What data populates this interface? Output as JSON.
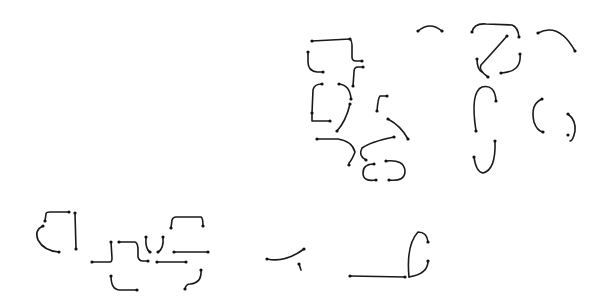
{
  "canvas": {
    "width": 605,
    "height": 304,
    "background": "#ffffff"
  },
  "style": {
    "stroke_color": "#1a1a1a",
    "stroke_width": 1.6,
    "endpoint_color": "#111111",
    "endpoint_radius": 1.6
  },
  "diagram": {
    "type": "stroke-primitives",
    "groups": [
      {
        "name": "upper-left-cluster",
        "strokes": [
          {
            "id": "s1",
            "d": "M312,41 L350,39",
            "ends": [
              [
                312,
                41
              ],
              [
                350,
                39
              ]
            ]
          },
          {
            "id": "s2",
            "d": "M350,39 Q352,41 352,45 L352,57 Q352,61 356,61 L362,61",
            "ends": [
              [
                362,
                61
              ]
            ]
          },
          {
            "id": "s3",
            "d": "M308,52 L308,62 Q308,71 317,72 L323,72",
            "ends": [
              [
                308,
                52
              ],
              [
                323,
                72
              ]
            ]
          },
          {
            "id": "s4",
            "d": "M363,67 L358,67 Q354,67 354,72 L353,86",
            "ends": [
              [
                363,
                67
              ],
              [
                353,
                86
              ]
            ]
          },
          {
            "id": "s5",
            "d": "M312,113 L313,90 Q314,84 322,84",
            "ends": [
              [
                322,
                84
              ],
              [
                312,
                113
              ]
            ]
          },
          {
            "id": "s6",
            "d": "M312,113 L312,121 L330,121",
            "ends": [
              [
                330,
                121
              ]
            ]
          },
          {
            "id": "s7",
            "d": "M339,84 Q350,85 351,99",
            "ends": [
              [
                339,
                84
              ],
              [
                351,
                99
              ]
            ]
          },
          {
            "id": "s8",
            "d": "M350,104 Q346,121 337,131",
            "ends": [
              [
                350,
                104
              ],
              [
                337,
                131
              ]
            ]
          },
          {
            "id": "s9",
            "d": "M377,111 Q378,98 380,96 L387,96",
            "ends": [
              [
                377,
                111
              ],
              [
                387,
                96
              ]
            ]
          },
          {
            "id": "s10",
            "d": "M388,119 Q401,126 408,139",
            "ends": [
              [
                388,
                119
              ],
              [
                408,
                139
              ]
            ]
          },
          {
            "id": "s11",
            "d": "M317,139 L338,139 Q352,141 355,152 Q352,160 349,163 L349,165",
            "ends": [
              [
                317,
                139
              ],
              [
                349,
                165
              ]
            ]
          },
          {
            "id": "s12",
            "d": "M394,137 Q370,142 362,148 Q358,156 366,160",
            "ends": [
              [
                394,
                137
              ],
              [
                366,
                160
              ]
            ]
          },
          {
            "id": "s13",
            "d": "M374,164 Q363,164 363,173 Q363,182 376,180",
            "ends": [
              [
                374,
                164
              ],
              [
                376,
                180
              ]
            ]
          },
          {
            "id": "s14",
            "d": "M386,161 Q404,159 405,171 Q405,182 389,180",
            "ends": [
              [
                386,
                161
              ],
              [
                389,
                180
              ]
            ]
          }
        ]
      },
      {
        "name": "top-small-arc",
        "strokes": [
          {
            "id": "s15",
            "d": "M418,31 Q430,21 442,31",
            "ends": [
              [
                418,
                31
              ],
              [
                442,
                31
              ]
            ]
          }
        ]
      },
      {
        "name": "upper-right-cluster",
        "strokes": [
          {
            "id": "s16",
            "d": "M472,32 Q474,23 486,24 L512,25 Q518,27 519,37",
            "ends": [
              [
                472,
                32
              ],
              [
                519,
                37
              ]
            ]
          },
          {
            "id": "s17",
            "d": "M507,36 Q493,52 481,65 Q478,70 488,77",
            "ends": [
              [
                507,
                36
              ],
              [
                488,
                77
              ]
            ]
          },
          {
            "id": "s18",
            "d": "M477,59 Q477,69 482,72",
            "ends": [
              [
                477,
                59
              ]
            ]
          },
          {
            "id": "s19",
            "d": "M520,54 Q522,72 501,73",
            "ends": [
              [
                520,
                54
              ],
              [
                501,
                73
              ]
            ]
          },
          {
            "id": "s20",
            "d": "M538,33 Q559,22 575,51",
            "ends": [
              [
                538,
                33
              ],
              [
                575,
                51
              ]
            ]
          }
        ]
      },
      {
        "name": "right-arcs",
        "strokes": [
          {
            "id": "s21",
            "d": "M476,131 Q470,92 482,87 Q495,84 496,101",
            "ends": [
              [
                476,
                131
              ],
              [
                496,
                101
              ]
            ]
          },
          {
            "id": "s22",
            "d": "M495,141 Q496,170 483,173 Q476,172 474,157",
            "ends": [
              [
                495,
                141
              ],
              [
                474,
                157
              ]
            ]
          },
          {
            "id": "s23",
            "d": "M542,99 Q530,104 534,122 Q537,131 543,132",
            "ends": [
              [
                542,
                99
              ],
              [
                543,
                132
              ]
            ]
          },
          {
            "id": "s24",
            "d": "M568,114 Q576,120 575,131 Q573,141 570,141",
            "ends": [
              [
                568,
                114
              ],
              [
                568,
                135
              ]
            ]
          }
        ]
      },
      {
        "name": "lower-left-cluster",
        "strokes": [
          {
            "id": "s25",
            "d": "M45,221 L46,214 Q46,212 50,212 L69,212",
            "ends": [
              [
                45,
                221
              ],
              [
                69,
                212
              ]
            ]
          },
          {
            "id": "s26",
            "d": "M75,213 L76,249",
            "ends": [
              [
                75,
                213
              ],
              [
                76,
                249
              ]
            ]
          },
          {
            "id": "s27",
            "d": "M43,226 Q34,230 38,240 Q44,251 59,252",
            "ends": [
              [
                43,
                226
              ],
              [
                59,
                252
              ]
            ]
          },
          {
            "id": "s28",
            "d": "M92,262 L110,262 Q112,262 112,258 L111,242",
            "ends": [
              [
                92,
                262
              ],
              [
                111,
                242
              ]
            ]
          },
          {
            "id": "s29",
            "d": "M119,242 L135,242 Q138,243 138,250 L138,257 Q139,261 143,261 L148,261",
            "ends": [
              [
                119,
                242
              ],
              [
                148,
                261
              ]
            ]
          },
          {
            "id": "s30",
            "d": "M146,237 Q145,249 150,252",
            "ends": [
              [
                146,
                237
              ],
              [
                150,
                252
              ]
            ]
          },
          {
            "id": "s31",
            "d": "M163,237 Q164,249 158,252",
            "ends": [
              [
                163,
                237
              ],
              [
                158,
                252
              ]
            ]
          },
          {
            "id": "s32",
            "d": "M157,262 L186,262",
            "ends": [
              [
                157,
                262
              ],
              [
                186,
                262
              ]
            ]
          },
          {
            "id": "s33",
            "d": "M171,228 L172,220 Q173,217 176,217 L201,217 Q203,218 203,226",
            "ends": [
              [
                171,
                228
              ],
              [
                203,
                226
              ]
            ]
          },
          {
            "id": "s34",
            "d": "M174,252 L208,252",
            "ends": [
              [
                174,
                252
              ],
              [
                208,
                252
              ]
            ]
          },
          {
            "id": "s35",
            "d": "M111,276 Q111,290 120,290 L137,290",
            "ends": [
              [
                111,
                276
              ],
              [
                137,
                290
              ]
            ]
          },
          {
            "id": "s36",
            "d": "M201,270 Q202,283 190,284 Q186,284 185,289",
            "ends": [
              [
                201,
                270
              ],
              [
                185,
                289
              ]
            ]
          }
        ]
      },
      {
        "name": "lower-middle",
        "strokes": [
          {
            "id": "s37",
            "d": "M267,259 Q285,263 304,249",
            "ends": [
              [
                267,
                259
              ],
              [
                304,
                249
              ]
            ]
          },
          {
            "id": "s38",
            "d": "M299,264 L301,270",
            "ends": [
              [
                299,
                264
              ]
            ]
          },
          {
            "id": "s39",
            "d": "M350,276 L405,277",
            "ends": [
              [
                350,
                276
              ],
              [
                405,
                277
              ]
            ]
          },
          {
            "id": "s40",
            "d": "M409,277 Q406,245 418,232 Q427,232 428,242",
            "ends": [
              [
                428,
                242
              ]
            ]
          },
          {
            "id": "s41",
            "d": "M409,277 Q428,274 428,261",
            "ends": [
              [
                428,
                261
              ]
            ]
          }
        ]
      }
    ]
  }
}
